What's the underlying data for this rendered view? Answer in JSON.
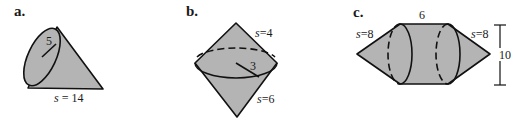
{
  "figures": [
    {
      "id": "a",
      "label": "a.",
      "kind": "cone",
      "radius_label": "5",
      "slant_label_var": "s",
      "slant_label_eq": " = ",
      "slant_label_val": "14"
    },
    {
      "id": "b",
      "label": "b.",
      "kind": "double-cone",
      "radius_label": "3",
      "top_slant_var": "s",
      "top_slant_eq": "=",
      "top_slant_val": "4",
      "bottom_slant_var": "s",
      "bottom_slant_eq": "=",
      "bottom_slant_val": "6"
    },
    {
      "id": "c",
      "label": "c.",
      "kind": "cylinder-with-two-cones",
      "length_label": "6",
      "left_slant_var": "s",
      "left_slant_eq": "=",
      "left_slant_val": "8",
      "right_slant_var": "s",
      "right_slant_eq": "=",
      "right_slant_val": "8",
      "height_label": "10"
    }
  ],
  "colors": {
    "fill": "#b4b4b4",
    "stroke": "#111111",
    "background": "#ffffff"
  }
}
